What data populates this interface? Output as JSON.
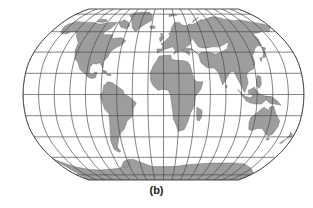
{
  "figure": {
    "caption": "(b)",
    "title": "",
    "kind": "world-map-projection"
  },
  "map": {
    "projection_name": "robinson",
    "description": "Pseudocylindrical world map projection with graticule",
    "colors": {
      "background": "#ffffff",
      "ocean": "#ffffff",
      "land_fill": "#9d9d9d",
      "land_stroke": "#6a6a6a",
      "graticule": "#4a4a4a",
      "outline": "#3a3a3a",
      "caption_text": "#1a1a1a"
    },
    "graticule": {
      "meridian_step_degrees": 20,
      "parallel_step_degrees": 20,
      "meridian_longitudes": [
        -180,
        -160,
        -140,
        -120,
        -100,
        -80,
        -60,
        -40,
        -20,
        0,
        20,
        40,
        60,
        80,
        100,
        120,
        140,
        160,
        180
      ],
      "parallel_latitudes": [
        -80,
        -60,
        -40,
        -20,
        0,
        20,
        40,
        60,
        80
      ],
      "equator_latitude": 0,
      "central_meridian": 0,
      "show_grid": true,
      "line_width_px": 0.7
    },
    "extent": {
      "left_px": 23,
      "right_px": 304,
      "top_px": 9,
      "bottom_px": 180,
      "width_px": 281,
      "height_px": 171
    },
    "landmasses": [
      "north-america",
      "greenland",
      "south-america",
      "africa",
      "europe",
      "asia",
      "australia",
      "antarctica",
      "indonesia",
      "new-zealand",
      "madagascar",
      "japan",
      "british-isles",
      "iceland"
    ]
  }
}
